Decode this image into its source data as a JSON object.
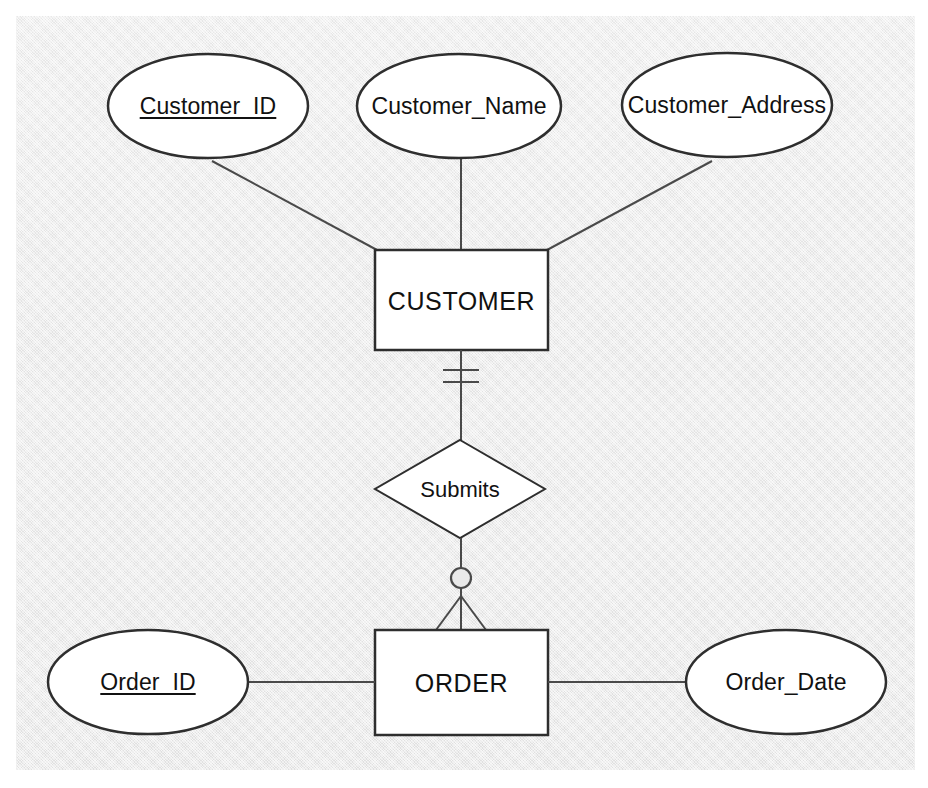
{
  "diagram": {
    "type": "entity-relationship-diagram",
    "notation": "crows-foot",
    "canvas_color": "#e9e9e9",
    "shape_fill": "#ffffff",
    "stroke_color": "#3b3b3b",
    "text_color": "#111111"
  },
  "entities": [
    {
      "id": "customer",
      "label": "CUSTOMER",
      "shape": "rectangle",
      "x": 375,
      "y": 250,
      "w": 173,
      "h": 100
    },
    {
      "id": "order",
      "label": "ORDER",
      "shape": "rectangle",
      "x": 375,
      "y": 630,
      "w": 173,
      "h": 105
    }
  ],
  "attributes": [
    {
      "id": "customer_id",
      "label": "Customer_ID",
      "entity": "customer",
      "primary_key": true,
      "shape": "ellipse",
      "cx": 208,
      "cy": 106,
      "rx": 100,
      "ry": 52
    },
    {
      "id": "customer_name",
      "label": "Customer_Name",
      "entity": "customer",
      "primary_key": false,
      "shape": "ellipse",
      "cx": 459,
      "cy": 106,
      "rx": 102,
      "ry": 52
    },
    {
      "id": "customer_address",
      "label": "Customer_Address",
      "entity": "customer",
      "primary_key": false,
      "shape": "ellipse",
      "cx": 727,
      "cy": 105,
      "rx": 105,
      "ry": 52
    },
    {
      "id": "order_id",
      "label": "Order_ID",
      "entity": "order",
      "primary_key": true,
      "shape": "ellipse",
      "cx": 148,
      "cy": 682,
      "rx": 100,
      "ry": 52
    },
    {
      "id": "order_date",
      "label": "Order_Date",
      "entity": "order",
      "primary_key": false,
      "shape": "ellipse",
      "cx": 786,
      "cy": 682,
      "rx": 100,
      "ry": 52
    }
  ],
  "relationships": [
    {
      "id": "submits",
      "label": "Submits",
      "shape": "diamond",
      "from_entity": "CUSTOMER",
      "to_entity": "ORDER",
      "cx": 460,
      "cy": 489,
      "rx": 85,
      "ry": 49,
      "from_cardinality": "one-and-only-one",
      "from_cardinality_symbol": "double-tick",
      "to_cardinality": "zero-or-many",
      "to_cardinality_symbol": "circle-crowsfoot"
    }
  ]
}
